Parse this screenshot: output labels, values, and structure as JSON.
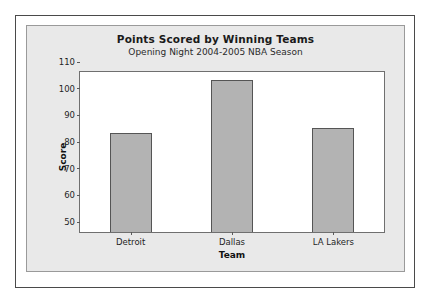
{
  "chart_data": {
    "type": "bar",
    "title": "Points Scored by Winning Teams",
    "subtitle": "Opening Night 2004-2005 NBA Season",
    "xlabel": "Team",
    "ylabel": "Score",
    "categories": [
      "Detroit",
      "Dallas",
      "LA Lakers"
    ],
    "values": [
      87,
      107,
      89
    ],
    "ylim": [
      50,
      110
    ],
    "yticks": [
      50,
      60,
      70,
      80,
      90,
      100,
      110
    ],
    "grid": false,
    "legend": false,
    "bar_color": "#b3b3b3",
    "bar_border_color": "#555555",
    "panel_color": "#e9e9e9",
    "frame_color": "#4a4a4a",
    "plot_background": "#ffffff"
  }
}
